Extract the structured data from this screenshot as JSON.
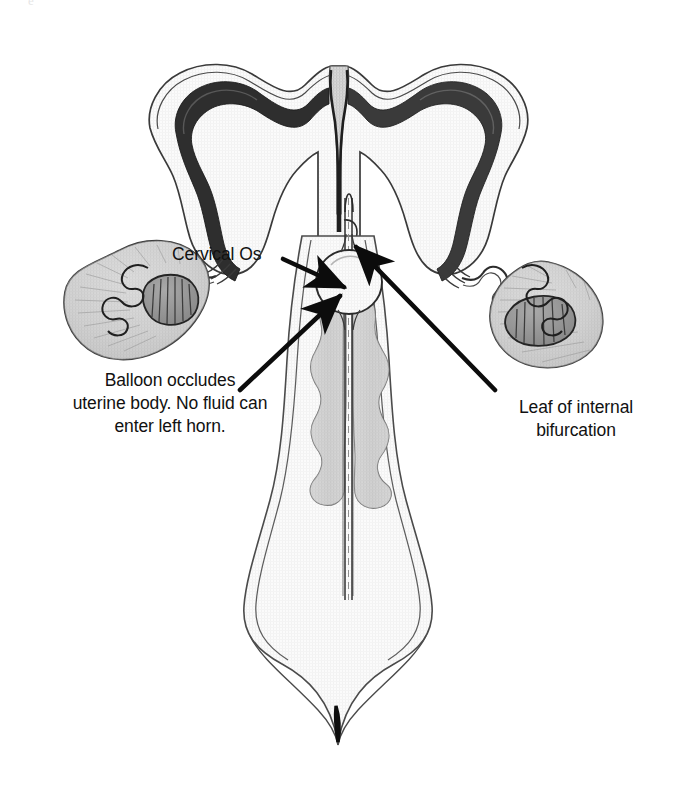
{
  "figure": {
    "domain": "diagram",
    "style": "pencil / ink medical line drawing, grayscale",
    "background_color": "#ffffff",
    "ink_color": "#1a1a1a",
    "tissue_fill": "#fafafa",
    "shade_fill": "#c9c9c9",
    "endometrium_color": "#2b2b2b"
  },
  "annotations": {
    "cervical_os": {
      "text": "Cervical Os",
      "x": 172,
      "y": 243
    },
    "balloon": {
      "text": "Balloon occludes\nuterine body. No fluid can\nenter left horn.",
      "x": 54,
      "y": 369
    },
    "leaf": {
      "text": "Leaf of internal\nbifurcation",
      "x": 486,
      "y": 396
    }
  },
  "leader_lines": [
    {
      "name": "cervical-os-arrow",
      "from": [
        283,
        261
      ],
      "to": [
        349,
        289
      ],
      "points_at": "cervical os / external opening"
    },
    {
      "name": "balloon-arrow",
      "from": [
        243,
        389
      ],
      "to": [
        344,
        295
      ],
      "points_at": "inflated occlusion balloon in uterine body"
    },
    {
      "name": "leaf-arrow",
      "from": [
        493,
        389
      ],
      "to": [
        355,
        246
      ],
      "points_at": "leaf of internal bifurcation (uterine septum)"
    }
  ],
  "anatomy_parts": [
    {
      "name": "left-uterine-horn",
      "side": "left"
    },
    {
      "name": "right-uterine-horn",
      "side": "right"
    },
    {
      "name": "left-ovary",
      "side": "left"
    },
    {
      "name": "right-ovary",
      "side": "right"
    },
    {
      "name": "left-oviduct",
      "side": "left"
    },
    {
      "name": "right-oviduct",
      "side": "right"
    },
    {
      "name": "uterine-body",
      "side": "center"
    },
    {
      "name": "internal-bifurcation-leaf",
      "side": "center"
    },
    {
      "name": "cervical-folds",
      "side": "center"
    },
    {
      "name": "vaginal-canal",
      "side": "center"
    },
    {
      "name": "catheter-shaft",
      "side": "center"
    },
    {
      "name": "occlusion-balloon",
      "side": "center"
    },
    {
      "name": "vulvar-slit",
      "side": "center"
    }
  ],
  "page_artifact": {
    "text": "e"
  }
}
